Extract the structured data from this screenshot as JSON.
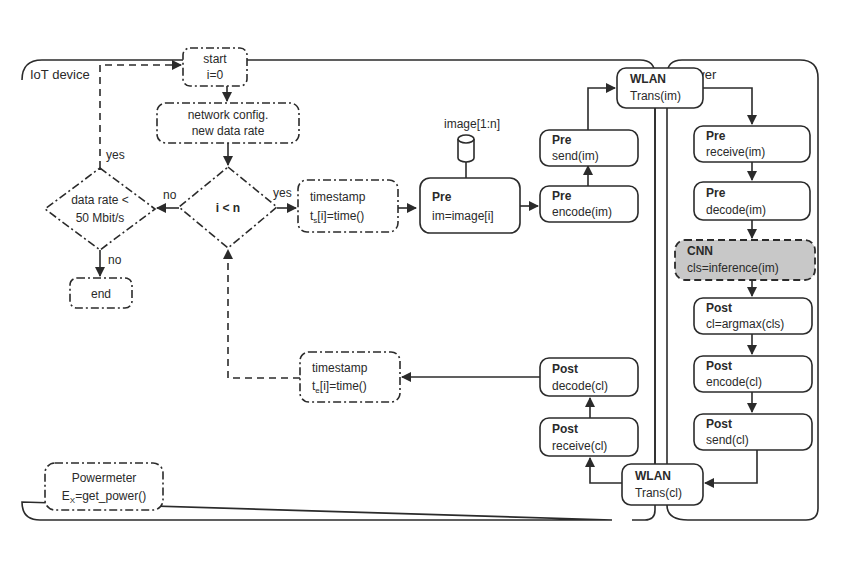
{
  "panels": {
    "device": {
      "label": "IoT device"
    },
    "server": {
      "label": "Server"
    }
  },
  "nodes": {
    "start": {
      "line1": "start",
      "line2": "i=0"
    },
    "network_config": {
      "line1": "network config.",
      "line2": "new data rate"
    },
    "loop_condition": {
      "label": "i < n"
    },
    "rate_condition": {
      "line1": "data rate <",
      "line2": "50 Mbit/s"
    },
    "end": {
      "label": "end"
    },
    "timestamp_start": {
      "line1": "timestamp",
      "line2_prefix": "t",
      "line2_sub": "s",
      "line2_suffix": "[i]=time()"
    },
    "image_db": {
      "label": "image[1:n]"
    },
    "pre_load": {
      "title": "Pre",
      "body": "im=image[i]"
    },
    "pre_encode": {
      "title": "Pre",
      "body": "encode(im)"
    },
    "pre_send": {
      "title": "Pre",
      "body": "send(im)"
    },
    "wlan_im": {
      "title": "WLAN",
      "body": "Trans(im)"
    },
    "pre_receive": {
      "title": "Pre",
      "body": "receive(im)"
    },
    "pre_decode": {
      "title": "Pre",
      "body": "decode(im)"
    },
    "cnn": {
      "title": "CNN",
      "body": "cls=inference(im)"
    },
    "post_argmax": {
      "title": "Post",
      "body": "cl=argmax(cls)"
    },
    "post_encode": {
      "title": "Post",
      "body": "encode(cl)"
    },
    "post_send": {
      "title": "Post",
      "body": "send(cl)"
    },
    "wlan_cl": {
      "title": "WLAN",
      "body": "Trans(cl)"
    },
    "post_receive": {
      "title": "Post",
      "body": "receive(cl)"
    },
    "post_decode": {
      "title": "Post",
      "body": "decode(cl)"
    },
    "timestamp_end": {
      "line1": "timestamp",
      "line2_prefix": "t",
      "line2_sub": "e",
      "line2_suffix": "[i]=time()"
    },
    "powermeter": {
      "line1": "Powermeter",
      "line2_prefix": "E",
      "line2_sub": "X",
      "line2_suffix": "=get_power()"
    }
  },
  "edge_labels": {
    "loop_yes": "yes",
    "loop_no": "no",
    "rate_yes": "yes",
    "rate_no": "no"
  },
  "colors": {
    "stroke": "#2b2b2b",
    "cnn_fill": "#c8c8c8",
    "background": "#ffffff"
  }
}
